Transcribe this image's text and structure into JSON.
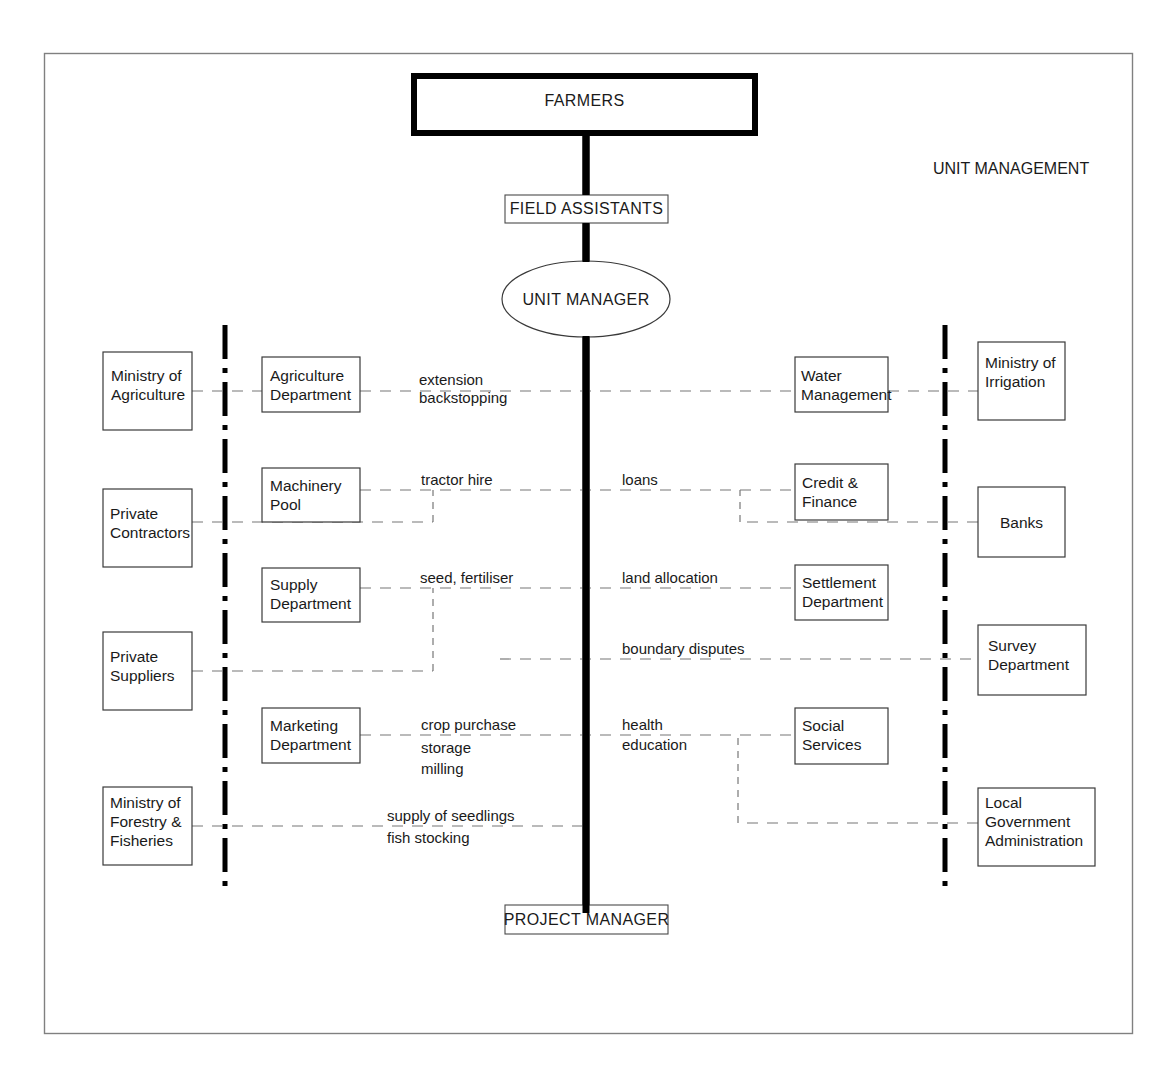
{
  "diagram": {
    "title_corner": "UNIT MANAGEMENT",
    "top_node": "FARMERS",
    "field_node": "FIELD ASSISTANTS",
    "center_node": "UNIT MANAGER",
    "bottom_node": "PROJECT MANAGER",
    "colors": {
      "background": "#ffffff",
      "border": "#808080",
      "line": "#000000",
      "dashed_line": "#777777",
      "text": "#1a1a1a"
    },
    "left_outer": [
      {
        "id": "ministry-of-agriculture",
        "lines": [
          "Ministry of",
          "Agriculture"
        ]
      },
      {
        "id": "private-contractors",
        "lines": [
          "Private",
          "Contractors"
        ]
      },
      {
        "id": "private-suppliers",
        "lines": [
          "Private",
          "Suppliers"
        ]
      },
      {
        "id": "ministry-of-forestry-fisheries",
        "lines": [
          "Ministry of",
          "Forestry &",
          "Fisheries"
        ]
      }
    ],
    "left_inner": [
      {
        "id": "agriculture-department",
        "lines": [
          "Agriculture",
          "Department"
        ]
      },
      {
        "id": "machinery-pool",
        "lines": [
          "Machinery",
          "Pool"
        ]
      },
      {
        "id": "supply-department",
        "lines": [
          "Supply",
          "Department"
        ]
      },
      {
        "id": "marketing-department",
        "lines": [
          "Marketing",
          "Department"
        ]
      }
    ],
    "right_inner": [
      {
        "id": "water-management",
        "lines": [
          "Water",
          "Management"
        ]
      },
      {
        "id": "credit-finance",
        "lines": [
          "Credit &",
          "Finance"
        ]
      },
      {
        "id": "settlement-department",
        "lines": [
          "Settlement",
          "Department"
        ]
      },
      {
        "id": "social-services",
        "lines": [
          "Social",
          "Services"
        ]
      }
    ],
    "right_outer": [
      {
        "id": "ministry-of-irrigation",
        "lines": [
          "Ministry of",
          "Irrigation"
        ]
      },
      {
        "id": "banks",
        "lines": [
          "Banks"
        ]
      },
      {
        "id": "survey-department",
        "lines": [
          "Survey",
          "Department"
        ]
      },
      {
        "id": "local-government-administration",
        "lines": [
          "Local",
          "Government",
          "Administration"
        ]
      }
    ],
    "left_edge_labels": [
      {
        "id": "extension-backstopping",
        "lines": [
          "extension",
          "backstopping"
        ]
      },
      {
        "id": "tractor-hire",
        "lines": [
          "tractor hire"
        ]
      },
      {
        "id": "seed-fertiliser",
        "lines": [
          "seed, fertiliser"
        ]
      },
      {
        "id": "crop-purchase-storage-milling",
        "lines": [
          "crop purchase",
          "storage",
          "milling"
        ]
      },
      {
        "id": "supply-of-seedlings-fish-stocking",
        "lines": [
          "supply of seedlings",
          "fish stocking"
        ]
      }
    ],
    "right_edge_labels": [
      {
        "id": "loans",
        "lines": [
          "loans"
        ]
      },
      {
        "id": "land-allocation",
        "lines": [
          "land allocation"
        ]
      },
      {
        "id": "boundary-disputes",
        "lines": [
          "boundary disputes"
        ]
      },
      {
        "id": "health-education",
        "lines": [
          "health",
          "education"
        ]
      }
    ]
  }
}
